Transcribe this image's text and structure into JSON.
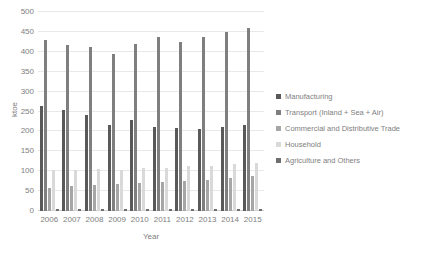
{
  "chart_data": {
    "type": "bar",
    "title": "",
    "xlabel": "Year",
    "ylabel": "ktoe",
    "categories": [
      "2006",
      "2007",
      "2008",
      "2009",
      "2010",
      "2011",
      "2012",
      "2013",
      "2014",
      "2015"
    ],
    "ylim": [
      0,
      500
    ],
    "yticks": [
      0,
      50,
      100,
      150,
      200,
      250,
      300,
      350,
      400,
      450,
      500
    ],
    "grid": true,
    "legend_position": "right",
    "series": [
      {
        "name": "Manufacturing",
        "color": "#595959",
        "values": [
          265,
          255,
          240,
          215,
          228,
          212,
          208,
          207,
          210,
          215
        ]
      },
      {
        "name": "Transport (Inland + Sea + Air)",
        "color": "#7f7f7f",
        "values": [
          430,
          417,
          411,
          395,
          420,
          437,
          425,
          437,
          449,
          460
        ]
      },
      {
        "name": "Commercial and Distributive Trade",
        "color": "#a6a6a6",
        "values": [
          58,
          62,
          65,
          67,
          70,
          72,
          75,
          78,
          82,
          88
        ]
      },
      {
        "name": "Household",
        "color": "#d9d9d9",
        "values": [
          102,
          103,
          106,
          104,
          108,
          109,
          112,
          113,
          117,
          120
        ]
      },
      {
        "name": "Agriculture and Others",
        "color": "#6e6e6e",
        "values": [
          4,
          4,
          4,
          4,
          5,
          4,
          4,
          4,
          4,
          5
        ]
      }
    ]
  }
}
